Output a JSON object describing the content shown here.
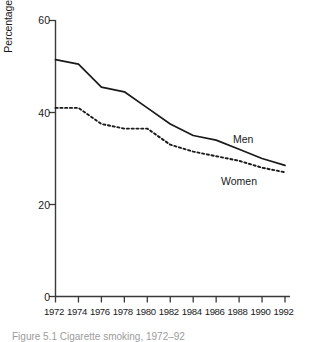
{
  "chart_data": {
    "type": "line",
    "title": "",
    "xlabel": "",
    "ylabel": "Percentage smoking cigarettes",
    "categories": [
      1972,
      1974,
      1976,
      1978,
      1980,
      1982,
      1984,
      1986,
      1988,
      1990,
      1992
    ],
    "x_tick_labels": [
      "1972",
      "1974",
      "1976",
      "1978",
      "1980",
      "1982",
      "1984",
      "1986",
      "1988",
      "1990",
      "1992"
    ],
    "y_tick_labels": [
      "0",
      "20",
      "40",
      "60"
    ],
    "y_ticks": [
      0,
      20,
      40,
      60
    ],
    "xlim": [
      1972,
      1992
    ],
    "ylim": [
      0,
      60
    ],
    "grid": false,
    "legend_position": "inline-annotation",
    "series": [
      {
        "name": "Men",
        "style": "solid",
        "color": "#1a1a1a",
        "values": [
          51.5,
          50.5,
          45.5,
          44.5,
          41.0,
          37.5,
          35.0,
          34.0,
          32.0,
          30.0,
          28.5
        ]
      },
      {
        "name": "Women",
        "style": "dotted",
        "color": "#1a1a1a",
        "values": [
          41.0,
          41.0,
          37.5,
          36.5,
          36.5,
          33.0,
          31.5,
          30.5,
          29.5,
          28.0,
          27.0
        ]
      }
    ],
    "annotations": [
      {
        "text": "Men",
        "series": "Men"
      },
      {
        "text": "Women",
        "series": "Women"
      }
    ]
  },
  "caption": {
    "text": "Figure 5.1   Cigarette smoking, 1972–92"
  }
}
